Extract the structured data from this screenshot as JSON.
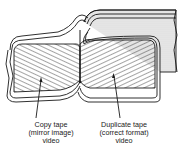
{
  "diagram": {
    "type": "technical-illustration",
    "labels": [
      {
        "id": "copy",
        "lines": [
          "Copy tape",
          "(mirror image)",
          "video"
        ]
      },
      {
        "id": "duplicate",
        "lines": [
          "Duplicate tape",
          "(correct format)",
          "video"
        ]
      }
    ],
    "colors": {
      "ink": "#1a1a1a",
      "background": "#ffffff",
      "tape_fill": "#e4e4e4"
    }
  }
}
